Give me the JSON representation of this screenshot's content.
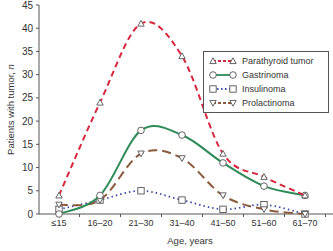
{
  "chart_data": {
    "type": "line",
    "title": "",
    "xlabel": "Age, years",
    "ylabel": "Patients with tumor, n",
    "categories": [
      "≤15",
      "16–20",
      "21–30",
      "31–40",
      "41–50",
      "51–60",
      "61–70"
    ],
    "ylim": [
      0,
      45
    ],
    "yticks": [
      0,
      5,
      10,
      15,
      20,
      25,
      30,
      35,
      40,
      45
    ],
    "grid": false,
    "legend_position": "upper right",
    "series": [
      {
        "name": "Parathyroid tumor",
        "color": "#d7263d",
        "dash": "6,4",
        "marker": "triangle-up",
        "values": [
          4,
          24,
          41,
          34,
          13,
          8,
          4
        ]
      },
      {
        "name": "Gastrinoma",
        "color": "#2e8b57",
        "dash": "",
        "marker": "circle",
        "values": [
          0,
          4,
          18,
          17,
          11,
          6,
          4
        ]
      },
      {
        "name": "Insulinoma",
        "color": "#3b4ba8",
        "dash": "1.5,3",
        "marker": "square",
        "values": [
          1,
          3,
          5,
          3,
          1,
          2,
          0
        ]
      },
      {
        "name": "Prolactinoma",
        "color": "#8b5a3c",
        "dash": "9,5",
        "marker": "triangle-down",
        "values": [
          2,
          3,
          13,
          12,
          4,
          1,
          0
        ]
      }
    ]
  }
}
